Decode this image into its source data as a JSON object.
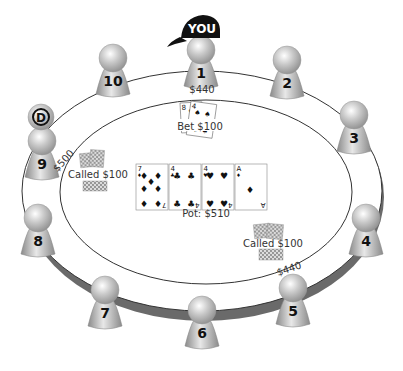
{
  "table": {
    "felt_color": "#ffffff",
    "rail_color": "#6a6a6a",
    "line_color": "#333333"
  },
  "you_label": "YOU",
  "dealer_button": "D",
  "seats": [
    {
      "number": "1",
      "x": 201,
      "y": 62,
      "is_you": true
    },
    {
      "number": "2",
      "x": 287,
      "y": 72
    },
    {
      "number": "3",
      "x": 354,
      "y": 127
    },
    {
      "number": "4",
      "x": 366,
      "y": 230
    },
    {
      "number": "5",
      "x": 293,
      "y": 300
    },
    {
      "number": "6",
      "x": 202,
      "y": 322
    },
    {
      "number": "7",
      "x": 105,
      "y": 302
    },
    {
      "number": "8",
      "x": 38,
      "y": 230
    },
    {
      "number": "9",
      "x": 42,
      "y": 153
    },
    {
      "number": "10",
      "x": 113,
      "y": 70
    }
  ],
  "stacks": {
    "seat1": "$440",
    "seat9": "$500",
    "seat5": "$440"
  },
  "actions": {
    "seat1": "Bet $100",
    "seat9": "Called $100",
    "seat5": "Called $100"
  },
  "board": [
    {
      "rank": "7",
      "suit": "♦",
      "suit_name": "diamonds"
    },
    {
      "rank": "4",
      "suit": "♣",
      "suit_name": "clubs"
    },
    {
      "rank": "4",
      "suit": "♥",
      "suit_name": "hearts"
    },
    {
      "rank": "A",
      "suit": "♦",
      "suit_name": "diamonds"
    }
  ],
  "hole_cards": [
    {
      "rank": "8",
      "suit": "♥"
    },
    {
      "rank": "4",
      "suit": "♠"
    }
  ],
  "pot": "Pot: $510"
}
